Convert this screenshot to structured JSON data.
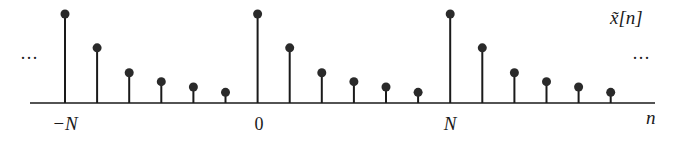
{
  "diagram": {
    "title": "x̃[n]",
    "signal_label": "x̃[n]",
    "axis_label": "n",
    "ellipsis_left": "···",
    "ellipsis_right": "···",
    "tick_labels": [
      {
        "text": "−N",
        "x": 65
      },
      {
        "text": "0",
        "x": 259
      },
      {
        "text": "N",
        "x": 450
      }
    ],
    "colors": {
      "ink": "#1a1a1a",
      "background": "#ffffff"
    }
  },
  "chart_data": {
    "type": "stem",
    "title": "x̃[n]",
    "xlabel": "n",
    "ylabel": "",
    "period_samples": 6,
    "period_values": [
      1.0,
      0.62,
      0.34,
      0.24,
      0.18,
      0.12
    ],
    "x_tick_labels": [
      "-N",
      "0",
      "N"
    ],
    "samples": [
      {
        "n": "-N",
        "value": 1.0
      },
      {
        "n": "-N+1",
        "value": 0.62
      },
      {
        "n": "-N+2",
        "value": 0.34
      },
      {
        "n": "-N+3",
        "value": 0.24
      },
      {
        "n": "-N+4",
        "value": 0.18
      },
      {
        "n": "-N+5",
        "value": 0.12
      },
      {
        "n": "0",
        "value": 1.0
      },
      {
        "n": "1",
        "value": 0.62
      },
      {
        "n": "2",
        "value": 0.34
      },
      {
        "n": "3",
        "value": 0.24
      },
      {
        "n": "4",
        "value": 0.18
      },
      {
        "n": "5",
        "value": 0.12
      },
      {
        "n": "N",
        "value": 1.0
      },
      {
        "n": "N+1",
        "value": 0.62
      },
      {
        "n": "N+2",
        "value": 0.34
      },
      {
        "n": "N+3",
        "value": 0.24
      },
      {
        "n": "N+4",
        "value": 0.18
      },
      {
        "n": "N+5",
        "value": 0.12
      }
    ],
    "grid": false,
    "legend": null
  }
}
